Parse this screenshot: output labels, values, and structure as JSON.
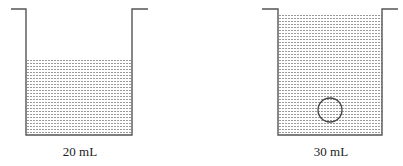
{
  "diagram": {
    "beakers": [
      {
        "id": "left",
        "label": "20 mL",
        "has_object": false
      },
      {
        "id": "right",
        "label": "30 mL",
        "has_object": true,
        "object": "sphere"
      }
    ],
    "colors": {
      "outline": "#555555",
      "fill_dots": "#9a9a9a"
    }
  }
}
